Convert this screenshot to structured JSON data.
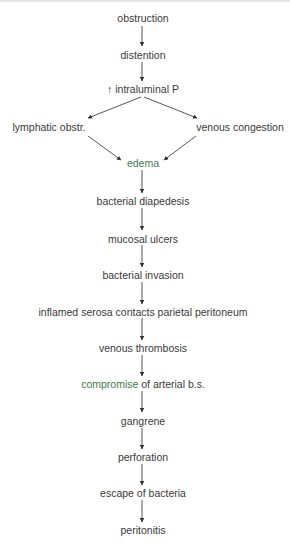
{
  "diagram": {
    "type": "flowchart",
    "direction": "top-to-bottom",
    "colors": {
      "text": "#3a3a3a",
      "highlight_text": "#3f7a4d",
      "arrow": "#333333"
    },
    "nodes": [
      {
        "id": "n1",
        "label": "obstruction",
        "x": 143,
        "y": 18
      },
      {
        "id": "n2",
        "label": "distention",
        "x": 143,
        "y": 55
      },
      {
        "id": "n3",
        "prefix": "↑",
        "label": "intraluminal P",
        "x": 143,
        "y": 89
      },
      {
        "id": "n4",
        "label": "lymphatic obstr.",
        "x": 49,
        "y": 127
      },
      {
        "id": "n5",
        "label": "venous congestion",
        "x": 240,
        "y": 127
      },
      {
        "id": "n6",
        "label": "edema",
        "x": 143,
        "y": 163,
        "highlight": true
      },
      {
        "id": "n7",
        "label": "bacterial diapedesis",
        "x": 143,
        "y": 201
      },
      {
        "id": "n8",
        "label": "mucosal ulcers",
        "x": 143,
        "y": 239
      },
      {
        "id": "n9",
        "label": "bacterial invasion",
        "x": 143,
        "y": 275
      },
      {
        "id": "n10",
        "label": "inflamed serosa contacts parietal peritoneum",
        "x": 143,
        "y": 312
      },
      {
        "id": "n11",
        "label": "venous thrombosis",
        "x": 143,
        "y": 348
      },
      {
        "id": "n12",
        "label_accent": "compromise",
        "label_rest": " of arterial b.s.",
        "x": 143,
        "y": 384
      },
      {
        "id": "n13",
        "label": "gangrene",
        "x": 143,
        "y": 421
      },
      {
        "id": "n14",
        "label": "perforation",
        "x": 143,
        "y": 457
      },
      {
        "id": "n15",
        "label": "escape of bacteria",
        "x": 143,
        "y": 493
      },
      {
        "id": "n16",
        "label": "peritonitis",
        "x": 143,
        "y": 530
      }
    ],
    "edges": [
      {
        "from": "n1",
        "to": "n2"
      },
      {
        "from": "n2",
        "to": "n3"
      },
      {
        "from": "n3",
        "to": "n4"
      },
      {
        "from": "n3",
        "to": "n5"
      },
      {
        "from": "n4",
        "to": "n6"
      },
      {
        "from": "n5",
        "to": "n6"
      },
      {
        "from": "n6",
        "to": "n7"
      },
      {
        "from": "n7",
        "to": "n8"
      },
      {
        "from": "n8",
        "to": "n9"
      },
      {
        "from": "n9",
        "to": "n10"
      },
      {
        "from": "n10",
        "to": "n11"
      },
      {
        "from": "n11",
        "to": "n12"
      },
      {
        "from": "n12",
        "to": "n13"
      },
      {
        "from": "n13",
        "to": "n14"
      },
      {
        "from": "n14",
        "to": "n15"
      },
      {
        "from": "n15",
        "to": "n16"
      }
    ]
  }
}
